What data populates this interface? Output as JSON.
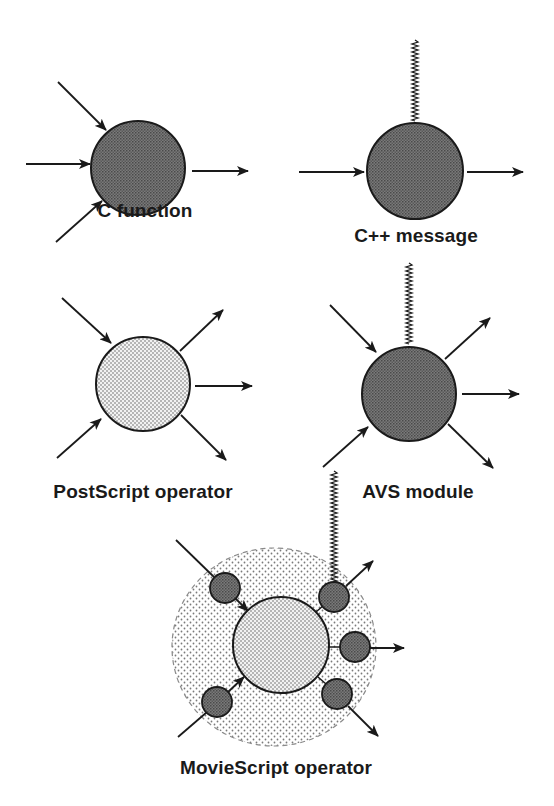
{
  "diagram": {
    "colors": {
      "background": "#ffffff",
      "ink": "#1a1a1a",
      "dark_fill": "#6a6a6a",
      "light_fill": "#e4e4e4",
      "outer_fill": "#f0f0f0"
    },
    "nodes": [
      {
        "id": "c-function",
        "label": "C function",
        "fill": "dark",
        "inputs": 3,
        "outputs": 1,
        "event_input": false
      },
      {
        "id": "cpp-message",
        "label": "C++ message",
        "fill": "dark",
        "inputs": 1,
        "outputs": 1,
        "event_input": true
      },
      {
        "id": "postscript-operator",
        "label": "PostScript operator",
        "fill": "light",
        "inputs": 2,
        "outputs": 3,
        "event_input": false
      },
      {
        "id": "avs-module",
        "label": "AVS module",
        "fill": "dark",
        "inputs": 2,
        "outputs": 3,
        "event_input": true
      },
      {
        "id": "moviescript-operator",
        "label": "MovieScript operator",
        "fill": "light",
        "inputs": 2,
        "outputs": 3,
        "event_input": true,
        "wrapped_by_small_nodes": 5
      }
    ]
  }
}
